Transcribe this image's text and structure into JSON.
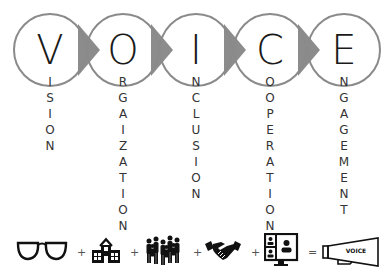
{
  "title": "VOICE",
  "stages": [
    {
      "letter": "V",
      "rest": [
        "I",
        "S",
        "I",
        "O",
        "N"
      ],
      "word": "VISION",
      "icon": "eyeglasses-icon"
    },
    {
      "letter": "O",
      "rest": [
        "R",
        "G",
        "A",
        "I",
        "Z",
        "A",
        "T",
        "I",
        "O",
        "N"
      ],
      "word": "ORGAIZATION",
      "icon": "school-building-icon"
    },
    {
      "letter": "I",
      "rest": [
        "N",
        "C",
        "L",
        "U",
        "S",
        "I",
        "O",
        "N"
      ],
      "word": "INCLUSION",
      "icon": "crowd-people-icon"
    },
    {
      "letter": "C",
      "rest": [
        "O",
        "O",
        "P",
        "E",
        "R",
        "A",
        "T",
        "I",
        "O",
        "N"
      ],
      "word": "COOPERATION",
      "icon": "handshake-icon"
    },
    {
      "letter": "E",
      "rest": [
        "N",
        "G",
        "A",
        "G",
        "E",
        "M",
        "E",
        "N",
        "T"
      ],
      "word": "ENGAGEMENT",
      "icon": "video-conference-icon"
    }
  ],
  "equation": {
    "operators": [
      "+",
      "+",
      "+",
      "+",
      "="
    ],
    "result_label": "VOICE",
    "result_icon": "megaphone-icon"
  },
  "colors": {
    "circle_stroke": "#8a8a8a",
    "arrow_fill": "#8c8c8c",
    "text": "#1a1a1a",
    "icon": "#111111"
  }
}
